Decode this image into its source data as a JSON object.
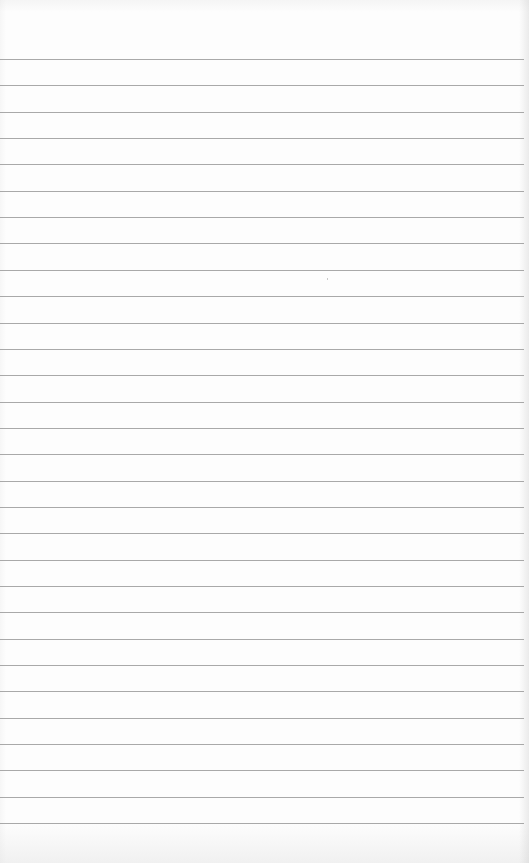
{
  "page": {
    "type": "lined-paper",
    "background_color": "#fdfdfd",
    "line_color": "#9a9a9a",
    "line_count": 30,
    "first_line_y": 59,
    "line_spacing": 26.35,
    "line_width": 524
  }
}
